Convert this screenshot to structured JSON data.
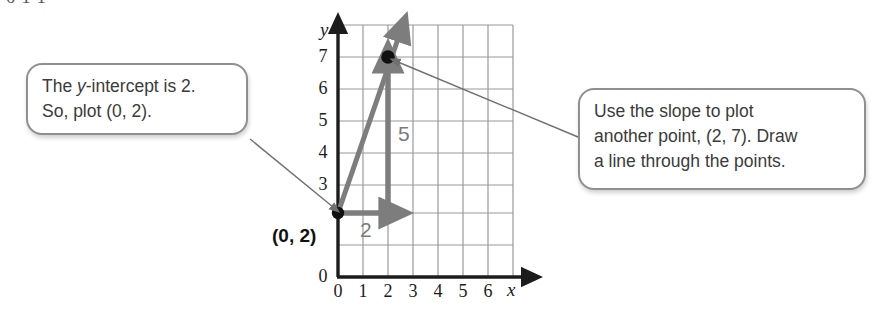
{
  "figure": {
    "type": "coordinate-graph-with-callouts",
    "top_cut_text": "0  1          1",
    "axis": {
      "x_letter": "x",
      "y_letter": "y",
      "x_ticks": [
        "0",
        "1",
        "2",
        "3",
        "4",
        "5",
        "6"
      ],
      "y_ticks": [
        "0",
        "3",
        "4",
        "5",
        "6",
        "7"
      ],
      "x_range": [
        0,
        7
      ],
      "y_range": [
        0,
        7.6
      ],
      "grid": true
    },
    "points": [
      {
        "label": "(0, 2)",
        "x": 0,
        "y": 2
      },
      {
        "label": "",
        "x": 2,
        "y": 7
      }
    ],
    "slope_triangle": {
      "run_label": "2",
      "rise_label": "5",
      "run": 2,
      "rise": 5
    },
    "line": {
      "description": "line through (0, 2) and (2, 7)",
      "slope": 2.5,
      "y_intercept": 2
    }
  },
  "callouts": {
    "left": {
      "line1_pre": "The ",
      "line1_italic": "y",
      "line1_post": "-intercept is 2.",
      "line2": "So, plot (0, 2)."
    },
    "right": {
      "line1": "Use the slope to plot",
      "line2": "another point, (2, 7). Draw",
      "line3": "a line through the points."
    }
  },
  "colors": {
    "grid": "#9a9a9a",
    "axis": "#1c1c1c",
    "arrow_gray": "#7d7d7d",
    "callout_border": "#8f8f8f",
    "point": "#111111",
    "pointer_line": "#707070"
  }
}
